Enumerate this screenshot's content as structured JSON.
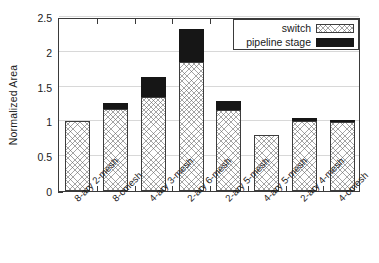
{
  "chart_data": {
    "type": "bar",
    "stacked": true,
    "title": "",
    "xlabel": "",
    "ylabel": "Normalized Area",
    "ylim": [
      0,
      2.5
    ],
    "yticks": [
      "0",
      "0.5",
      "1",
      "1.5",
      "2",
      "2.5"
    ],
    "ytick_values": [
      0,
      0.5,
      1,
      1.5,
      2,
      2.5
    ],
    "grid": "horizontal",
    "legend_position": "top-right",
    "categories": [
      "8-ary 2-mesh",
      "8-cmesh",
      "4-ary 3-mesh",
      "2-ary 6-mesh",
      "2-ary 5-mesh",
      "4-ary 5-mesh",
      "2-ary 4-mesh",
      "4-cmesh"
    ],
    "series": [
      {
        "name": "switch",
        "pattern": "crosshatch",
        "color": "#ffffff",
        "values": [
          1.0,
          1.18,
          1.35,
          1.85,
          1.17,
          0.8,
          1.0,
          0.99
        ]
      },
      {
        "name": "pipeline stage",
        "pattern": "solid",
        "color": "#161616",
        "values": [
          0.0,
          0.09,
          0.29,
          0.48,
          0.13,
          0.0,
          0.05,
          0.03
        ]
      }
    ],
    "totals": [
      1.0,
      1.27,
      1.64,
      2.33,
      1.3,
      0.8,
      1.05,
      1.02
    ]
  },
  "legend": {
    "entries": [
      {
        "label": "switch",
        "swatch": "crosshatch-swatch"
      },
      {
        "label": "pipeline stage",
        "swatch": "solid-black-swatch"
      }
    ]
  },
  "axes": {
    "y_title": "Normalized Area"
  }
}
